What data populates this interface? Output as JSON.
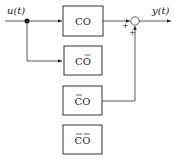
{
  "diagram": {
    "input_label": "u(t)",
    "output_label": "y(t)",
    "blocks": [
      {
        "id": "co",
        "label": "CO",
        "bar_c": false,
        "bar_o": false
      },
      {
        "id": "co-bar-o",
        "label": "CO",
        "bar_c": false,
        "bar_o": true
      },
      {
        "id": "bar-c-o",
        "label": "CO",
        "bar_c": true,
        "bar_o": false
      },
      {
        "id": "bar-c-bar-o",
        "label": "CO",
        "bar_c": true,
        "bar_o": true
      }
    ],
    "summing_junction": {
      "sign_top": "+",
      "sign_bottom": "+"
    }
  }
}
